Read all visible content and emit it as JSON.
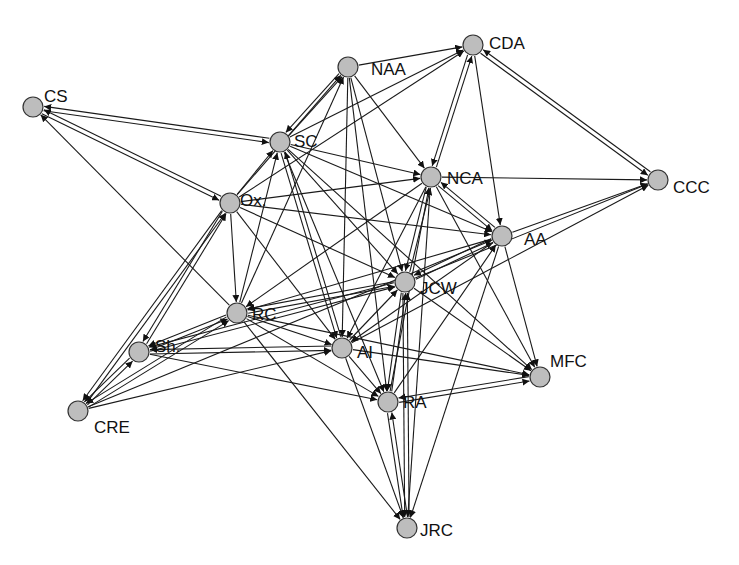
{
  "diagram": {
    "type": "directed-network",
    "node_fill": "#bdbdbd",
    "node_stroke": "#333333",
    "edge_color": "#1a1a1a",
    "node_radius": 10,
    "nodes": [
      {
        "id": "CS",
        "label": "CS",
        "x": 33,
        "y": 107,
        "lx": 44,
        "ly": 96,
        "anchor": "start"
      },
      {
        "id": "SC",
        "label": "SC",
        "x": 280,
        "y": 142,
        "lx": 294,
        "ly": 141,
        "anchor": "start"
      },
      {
        "id": "NAA",
        "label": "NAA",
        "x": 348,
        "y": 67,
        "lx": 371,
        "ly": 69,
        "anchor": "start"
      },
      {
        "id": "CDA",
        "label": "CDA",
        "x": 473,
        "y": 45,
        "lx": 489,
        "ly": 43,
        "anchor": "start"
      },
      {
        "id": "Ox",
        "label": "Ox.",
        "x": 230,
        "y": 203,
        "lx": 240,
        "ly": 200,
        "anchor": "start"
      },
      {
        "id": "NCA",
        "label": "NCA",
        "x": 431,
        "y": 177,
        "lx": 447,
        "ly": 178,
        "anchor": "start"
      },
      {
        "id": "CCC",
        "label": "CCC",
        "x": 658,
        "y": 180,
        "lx": 673,
        "ly": 187,
        "anchor": "start"
      },
      {
        "id": "AA",
        "label": "AA",
        "x": 502,
        "y": 236,
        "lx": 524,
        "ly": 239,
        "anchor": "start"
      },
      {
        "id": "JCW",
        "label": "JCW",
        "x": 405,
        "y": 282,
        "lx": 420,
        "ly": 288,
        "anchor": "start"
      },
      {
        "id": "RC",
        "label": "RC",
        "x": 237,
        "y": 313,
        "lx": 252,
        "ly": 314,
        "anchor": "start"
      },
      {
        "id": "Sh",
        "label": "Sh.",
        "x": 139,
        "y": 352,
        "lx": 155,
        "ly": 346,
        "anchor": "start"
      },
      {
        "id": "AI",
        "label": "AI",
        "x": 342,
        "y": 348,
        "lx": 357,
        "ly": 352,
        "anchor": "start"
      },
      {
        "id": "MFC",
        "label": "MFC",
        "x": 540,
        "y": 377,
        "lx": 550,
        "ly": 361,
        "anchor": "start"
      },
      {
        "id": "CRE",
        "label": "CRE",
        "x": 78,
        "y": 411,
        "lx": 94,
        "ly": 427,
        "anchor": "start"
      },
      {
        "id": "RA",
        "label": "RA",
        "x": 388,
        "y": 402,
        "lx": 403,
        "ly": 402,
        "anchor": "start"
      },
      {
        "id": "JRC",
        "label": "JRC",
        "x": 407,
        "y": 528,
        "lx": 420,
        "ly": 530,
        "anchor": "start"
      }
    ],
    "edges": [
      [
        "CS",
        "SC"
      ],
      [
        "SC",
        "CS"
      ],
      [
        "CS",
        "Ox"
      ],
      [
        "Ox",
        "CS"
      ],
      [
        "RC",
        "CS"
      ],
      [
        "NAA",
        "CDA"
      ],
      [
        "SC",
        "CDA"
      ],
      [
        "Ox",
        "CDA"
      ],
      [
        "CDA",
        "NCA"
      ],
      [
        "NCA",
        "CDA"
      ],
      [
        "CDA",
        "AA"
      ],
      [
        "CDA",
        "CCC"
      ],
      [
        "CCC",
        "CDA"
      ],
      [
        "NAA",
        "SC"
      ],
      [
        "NAA",
        "NCA"
      ],
      [
        "NAA",
        "JCW"
      ],
      [
        "NAA",
        "AI"
      ],
      [
        "NAA",
        "RA"
      ],
      [
        "SC",
        "NAA"
      ],
      [
        "Ox",
        "NAA"
      ],
      [
        "RC",
        "NAA"
      ],
      [
        "SC",
        "NCA"
      ],
      [
        "SC",
        "JCW"
      ],
      [
        "SC",
        "AA"
      ],
      [
        "SC",
        "AI"
      ],
      [
        "SC",
        "RA"
      ],
      [
        "SC",
        "MFC"
      ],
      [
        "Ox",
        "SC"
      ],
      [
        "RC",
        "SC"
      ],
      [
        "AI",
        "SC"
      ],
      [
        "Ox",
        "NCA"
      ],
      [
        "Ox",
        "AA"
      ],
      [
        "Ox",
        "JCW"
      ],
      [
        "Ox",
        "RC"
      ],
      [
        "Ox",
        "AI"
      ],
      [
        "Ox",
        "CRE"
      ],
      [
        "CRE",
        "Ox"
      ],
      [
        "Sh",
        "Ox"
      ],
      [
        "Ox",
        "Sh"
      ],
      [
        "NCA",
        "CCC"
      ],
      [
        "NCA",
        "AA"
      ],
      [
        "NCA",
        "JCW"
      ],
      [
        "NCA",
        "RC"
      ],
      [
        "NCA",
        "AI"
      ],
      [
        "NCA",
        "MFC"
      ],
      [
        "JCW",
        "NCA"
      ],
      [
        "AA",
        "NCA"
      ],
      [
        "RA",
        "NCA"
      ],
      [
        "AA",
        "CCC"
      ],
      [
        "JCW",
        "CCC"
      ],
      [
        "AI",
        "CCC"
      ],
      [
        "AA",
        "JCW"
      ],
      [
        "JCW",
        "AA"
      ],
      [
        "AA",
        "RC"
      ],
      [
        "AA",
        "AI"
      ],
      [
        "AA",
        "MFC"
      ],
      [
        "RA",
        "AA"
      ],
      [
        "CRE",
        "AA"
      ],
      [
        "JCW",
        "RC"
      ],
      [
        "RC",
        "JCW"
      ],
      [
        "JCW",
        "MFC"
      ],
      [
        "JCW",
        "RA"
      ],
      [
        "RA",
        "JCW"
      ],
      [
        "AI",
        "JCW"
      ],
      [
        "Sh",
        "JCW"
      ],
      [
        "JCW",
        "Sh"
      ],
      [
        "JRC",
        "JCW"
      ],
      [
        "RC",
        "AI"
      ],
      [
        "RC",
        "MFC"
      ],
      [
        "RC",
        "Sh"
      ],
      [
        "Sh",
        "RC"
      ],
      [
        "RC",
        "CRE"
      ],
      [
        "CRE",
        "RC"
      ],
      [
        "RC",
        "RA"
      ],
      [
        "RC",
        "JRC"
      ],
      [
        "Sh",
        "AI"
      ],
      [
        "AI",
        "Sh"
      ],
      [
        "Sh",
        "RA"
      ],
      [
        "CRE",
        "Sh"
      ],
      [
        "Sh",
        "CRE"
      ],
      [
        "AI",
        "MFC"
      ],
      [
        "AI",
        "RA"
      ],
      [
        "AI",
        "JRC"
      ],
      [
        "CRE",
        "AI"
      ],
      [
        "RA",
        "MFC"
      ],
      [
        "MFC",
        "RA"
      ],
      [
        "RA",
        "JRC"
      ],
      [
        "JRC",
        "RA"
      ],
      [
        "NCA",
        "JRC"
      ],
      [
        "JCW",
        "JRC"
      ],
      [
        "AA",
        "JRC"
      ]
    ]
  }
}
